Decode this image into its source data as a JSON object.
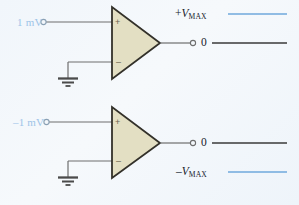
{
  "figure": {
    "name": "comparator-saturation-diagram",
    "background_color": "#f3f7fb",
    "width": 299,
    "height": 205
  },
  "colors": {
    "opamp_fill": "#e3dfc3",
    "opamp_stroke": "#33312a",
    "wire": "#6e6e6e",
    "rail_blue": "#6fa8dc",
    "output_dark": "#3a3a3a",
    "source_label": "#9ec4e8",
    "text": "#15202b"
  },
  "stages": [
    {
      "id": "upper",
      "source_label": "1 mV",
      "source_terminal": "input-terminal-circle",
      "plus_sign": "+",
      "minus_sign": "–",
      "ground_symbol": "ground-icon",
      "output_terminal": "output-terminal-circle",
      "output_label": "0",
      "rail": {
        "label_sign": "+",
        "label_symbol": "V",
        "label_subscript": "MAX",
        "label_text": "+VMAX"
      }
    },
    {
      "id": "lower",
      "source_label": "–1 mV",
      "source_terminal": "input-terminal-circle",
      "plus_sign": "+",
      "minus_sign": "–",
      "ground_symbol": "ground-icon",
      "output_terminal": "output-terminal-circle",
      "output_label": "0",
      "rail": {
        "label_sign": "–",
        "label_symbol": "V",
        "label_subscript": "MAX",
        "label_text": "–VMAX"
      }
    }
  ]
}
